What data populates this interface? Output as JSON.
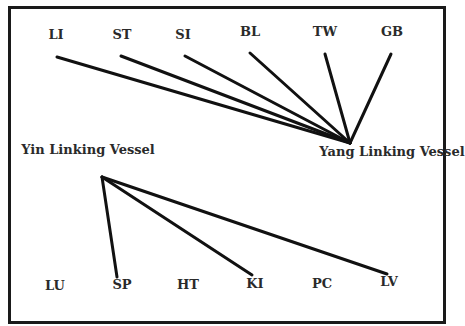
{
  "yang": {
    "label": "Yang Linking Vessel",
    "apex": [
      350,
      143
    ],
    "label_pos": [
      392,
      152
    ],
    "meridians": [
      {
        "name": "LI",
        "label_pos": [
          56,
          36
        ],
        "end": [
          57,
          57
        ]
      },
      {
        "name": "ST",
        "label_pos": [
          122,
          36
        ],
        "end": [
          121,
          56
        ]
      },
      {
        "name": "SI",
        "label_pos": [
          183,
          36
        ],
        "end": [
          185,
          56
        ]
      },
      {
        "name": "BL",
        "label_pos": [
          250,
          33
        ],
        "end": [
          250,
          53
        ]
      },
      {
        "name": "TW",
        "label_pos": [
          325,
          33
        ],
        "end": [
          325,
          54
        ]
      },
      {
        "name": "GB",
        "label_pos": [
          392,
          33
        ],
        "end": [
          391,
          54
        ]
      }
    ]
  },
  "yin": {
    "label": "Yin Linking Vessel",
    "apex": [
      102,
      177
    ],
    "label_pos": [
      88,
      150
    ],
    "meridians": [
      {
        "name": "LU",
        "label_pos": [
          55,
          287
        ],
        "end": null
      },
      {
        "name": "SP",
        "label_pos": [
          122,
          286
        ],
        "end": [
          117,
          277
        ]
      },
      {
        "name": "HT",
        "label_pos": [
          188,
          286
        ],
        "end": null
      },
      {
        "name": "KI",
        "label_pos": [
          255,
          285
        ],
        "end": [
          252,
          275
        ]
      },
      {
        "name": "PC",
        "label_pos": [
          322,
          285
        ],
        "end": null
      },
      {
        "name": "LV",
        "label_pos": [
          389,
          283
        ],
        "end": [
          387,
          274
        ]
      }
    ]
  },
  "colors": {
    "line": "#111111",
    "text": "#2a2a2a",
    "border": "#1a1a1a"
  }
}
